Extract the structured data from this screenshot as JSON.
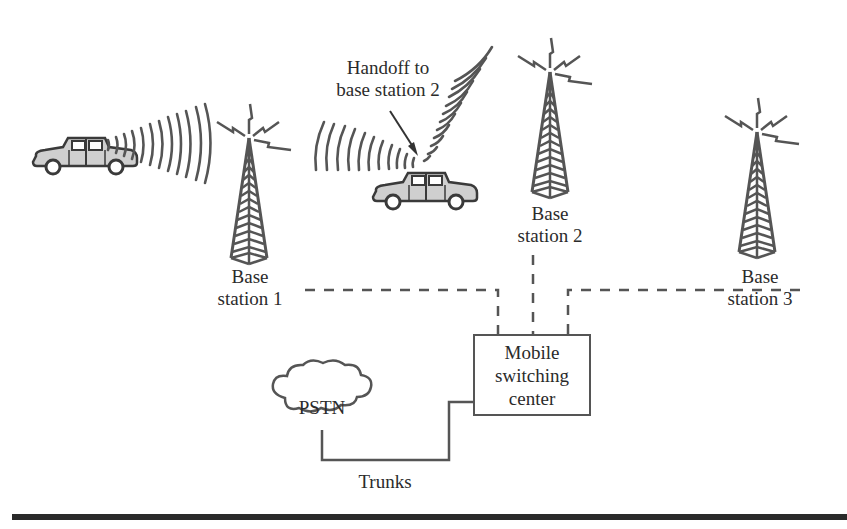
{
  "diagram": {
    "type": "cellular network handoff",
    "annotation": "Handoff to base station 2",
    "annotation_lines": [
      "Handoff to",
      "base station 2"
    ],
    "base_stations": [
      {
        "id": 1,
        "lines": [
          "Base",
          "station 1"
        ]
      },
      {
        "id": 2,
        "lines": [
          "Base",
          "station 2"
        ]
      },
      {
        "id": 3,
        "lines": [
          "Base",
          "station 3"
        ]
      }
    ],
    "msc": {
      "lines": [
        "Mobile",
        "switching",
        "center"
      ]
    },
    "pstn": {
      "label": "PSTN"
    },
    "trunks": {
      "label": "Trunks"
    },
    "vehicles": [
      {
        "name": "car-1",
        "connected_to": "Base station 1"
      },
      {
        "name": "car-2",
        "handoff_to": "Base station 2"
      }
    ],
    "colors": {
      "line": "#555555",
      "car_fill": "#cfcfcf",
      "text": "#2b2b2b",
      "rule": "#2a2a2a"
    }
  }
}
